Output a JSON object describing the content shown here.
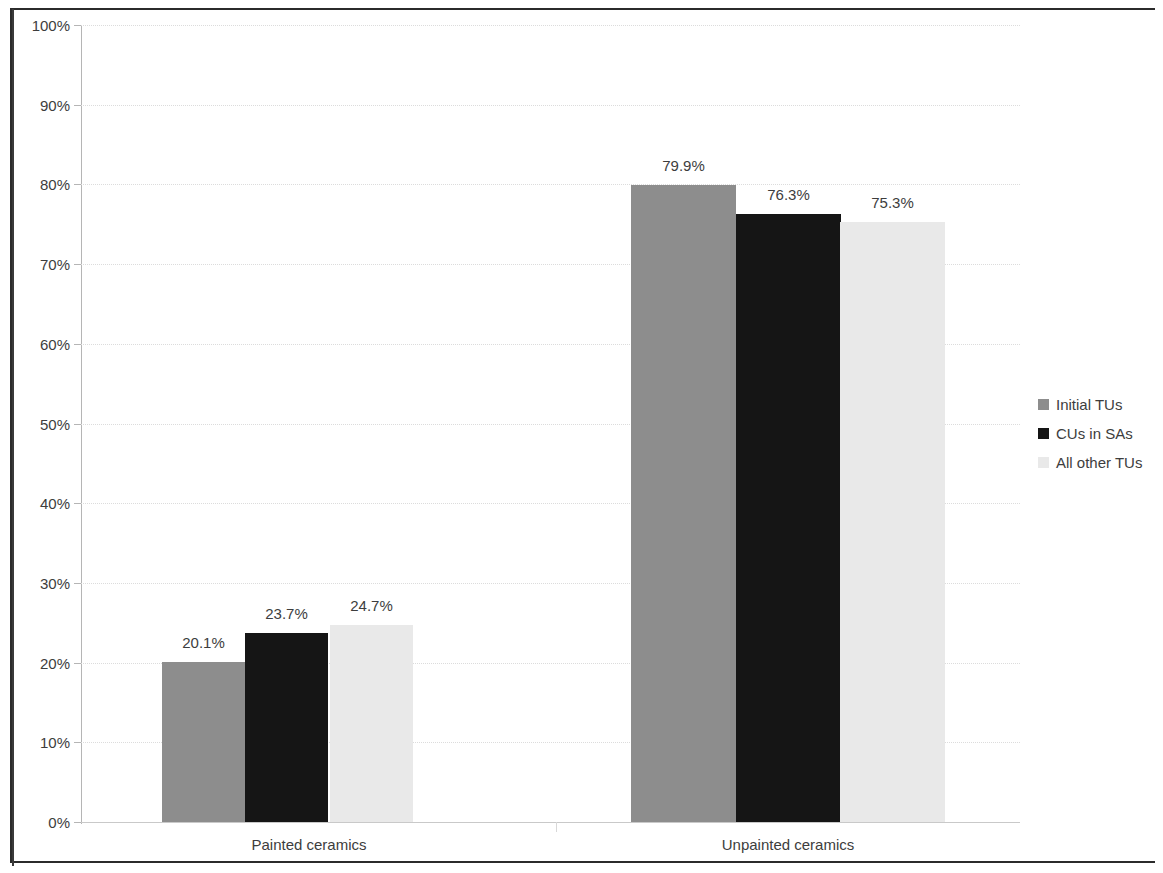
{
  "chart_data": {
    "type": "bar",
    "title": "",
    "subtitle": "",
    "xlabel": "",
    "ylabel": "",
    "categories": [
      "Painted ceramics",
      "Unpainted ceramics"
    ],
    "series": [
      {
        "name": "Initial TUs",
        "color": "#8d8d8d",
        "values": [
          20.1,
          79.9
        ],
        "labels": [
          "20.1%",
          "79.9%"
        ]
      },
      {
        "name": "CUs in SAs",
        "color": "#151515",
        "values": [
          23.7,
          76.3
        ],
        "labels": [
          "23.7%",
          "76.3%"
        ]
      },
      {
        "name": "All other TUs",
        "color": "#e9e9e9",
        "values": [
          24.7,
          75.3
        ],
        "labels": [
          "24.7%",
          "75.3%"
        ]
      }
    ],
    "ylim": [
      0,
      100
    ],
    "yticks": [
      0,
      10,
      20,
      30,
      40,
      50,
      60,
      70,
      80,
      90,
      100
    ],
    "ytick_labels": [
      "0%",
      "10%",
      "20%",
      "30%",
      "40%",
      "50%",
      "60%",
      "70%",
      "80%",
      "90%",
      "100%"
    ],
    "grid": true,
    "grid_axis": "y",
    "legend_position": "right",
    "data_labels": true,
    "value_suffix": "%"
  },
  "legend": {
    "entries": [
      {
        "label": "Initial TUs",
        "color": "#8d8d8d"
      },
      {
        "label": "CUs in SAs",
        "color": "#151515"
      },
      {
        "label": "All other TUs",
        "color": "#e9e9e9"
      }
    ]
  },
  "axis": {
    "y_labels": [
      "100%",
      "90%",
      "80%",
      "70%",
      "60%",
      "50%",
      "40%",
      "30%",
      "20%",
      "10%",
      "0%"
    ],
    "x_labels": [
      "Painted ceramics",
      "Unpainted ceramics"
    ]
  }
}
